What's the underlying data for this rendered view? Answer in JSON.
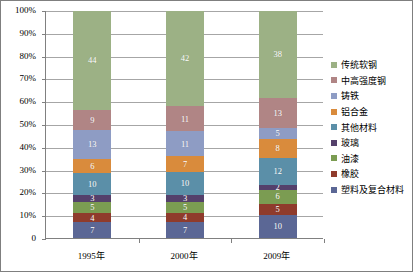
{
  "chart_data": {
    "type": "bar",
    "subtype": "stacked-100-percent",
    "title": "",
    "xlabel": "",
    "ylabel": "",
    "categories": [
      "1995年",
      "2000年",
      "2009年"
    ],
    "ylim": [
      0,
      100
    ],
    "ytick_labels": [
      "0",
      "10%",
      "20%",
      "30%",
      "40%",
      "50%",
      "60%",
      "70%",
      "80%",
      "90%",
      "100%"
    ],
    "ytick_values": [
      0,
      10,
      20,
      30,
      40,
      50,
      60,
      70,
      80,
      90,
      100
    ],
    "grid": true,
    "legend_position": "right",
    "stack_order_bottom_to_top": [
      "塑料及复合材料",
      "橡胶",
      "油漆",
      "玻璃",
      "其他材料",
      "铝合金",
      "铸铁",
      "中高强度钢",
      "传统软钢"
    ],
    "series": [
      {
        "name": "传统软钢",
        "color": "#9cb185",
        "values": [
          44,
          42,
          38
        ]
      },
      {
        "name": "中高强度钢",
        "color": "#b08585",
        "values": [
          9,
          11,
          13
        ]
      },
      {
        "name": "铸铁",
        "color": "#8e9cc4",
        "values": [
          13,
          11,
          5
        ]
      },
      {
        "name": "铝合金",
        "color": "#d98b3c",
        "values": [
          6,
          7,
          8
        ]
      },
      {
        "name": "其他材料",
        "color": "#5b8fa8",
        "values": [
          10,
          10,
          12
        ]
      },
      {
        "name": "玻璃",
        "color": "#54406b",
        "values": [
          3,
          3,
          2
        ]
      },
      {
        "name": "油漆",
        "color": "#7b9c52",
        "values": [
          5,
          5,
          6
        ]
      },
      {
        "name": "橡胶",
        "color": "#8f3b2c",
        "values": [
          4,
          4,
          5
        ]
      },
      {
        "name": "塑料及复合材料",
        "color": "#5b6795",
        "values": [
          7,
          7,
          10
        ]
      }
    ]
  },
  "legend": {
    "items": [
      {
        "label": "传统软钢",
        "color": "#9cb185"
      },
      {
        "label": "中高强度钢",
        "color": "#b08585"
      },
      {
        "label": "铸铁",
        "color": "#8e9cc4"
      },
      {
        "label": "铝合金",
        "color": "#d98b3c"
      },
      {
        "label": "其他材料",
        "color": "#5b8fa8"
      },
      {
        "label": "玻璃",
        "color": "#54406b"
      },
      {
        "label": "油漆",
        "color": "#7b9c52"
      },
      {
        "label": "橡胶",
        "color": "#8f3b2c"
      },
      {
        "label": "塑料及复合材料",
        "color": "#5b6795"
      }
    ]
  }
}
